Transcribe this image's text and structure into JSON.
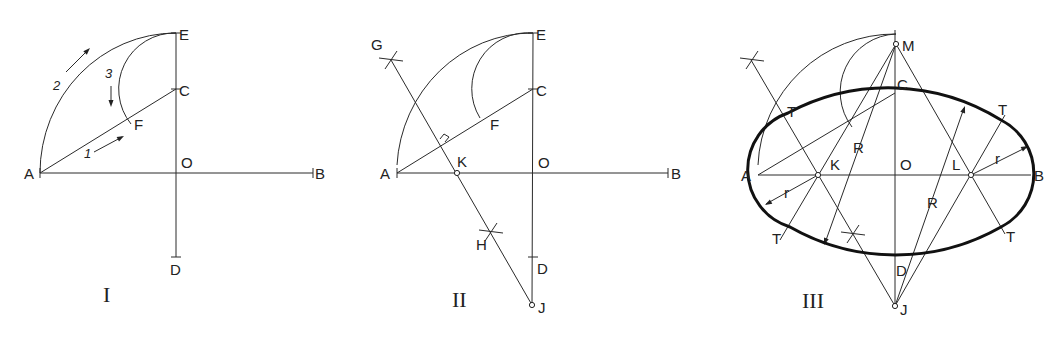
{
  "figure": {
    "panels": [
      {
        "id": "I",
        "numeral": "I",
        "numeral_pos": [
          103,
          302
        ],
        "points": {
          "A": [
            40,
            173
          ],
          "O": [
            176,
            173
          ],
          "B": [
            313,
            173
          ],
          "E": [
            176,
            33
          ],
          "C": [
            176,
            89
          ],
          "D": [
            176,
            257
          ],
          "F": [
            133,
            123
          ]
        },
        "labels": [
          {
            "text": "A",
            "x": 24,
            "y": 179
          },
          {
            "text": "B",
            "x": 315,
            "y": 179
          },
          {
            "text": "O",
            "x": 181,
            "y": 168
          },
          {
            "text": "E",
            "x": 179,
            "y": 40
          },
          {
            "text": "C",
            "x": 179,
            "y": 96
          },
          {
            "text": "D",
            "x": 170,
            "y": 275
          },
          {
            "text": "F",
            "x": 134,
            "y": 130
          }
        ],
        "step_labels": [
          {
            "text": "1",
            "x": 84,
            "y": 158
          },
          {
            "text": "2",
            "x": 53,
            "y": 90
          },
          {
            "text": "3",
            "x": 105,
            "y": 78
          }
        ]
      },
      {
        "id": "II",
        "numeral": "II",
        "numeral_pos": [
          452,
          307
        ],
        "points": {
          "A": [
            397,
            173
          ],
          "K": [
            457,
            173
          ],
          "O": [
            533,
            173
          ],
          "B": [
            668,
            173
          ],
          "E": [
            533,
            33
          ],
          "C": [
            533,
            89
          ],
          "F": [
            485,
            118
          ],
          "D": [
            533,
            257
          ],
          "J": [
            532,
            305
          ],
          "H": [
            491,
            232
          ],
          "G": [
            391,
            60
          ]
        },
        "labels": [
          {
            "text": "A",
            "x": 380,
            "y": 179
          },
          {
            "text": "K",
            "x": 457,
            "y": 167
          },
          {
            "text": "O",
            "x": 538,
            "y": 168
          },
          {
            "text": "B",
            "x": 671,
            "y": 179
          },
          {
            "text": "E",
            "x": 536,
            "y": 40
          },
          {
            "text": "C",
            "x": 536,
            "y": 96
          },
          {
            "text": "F",
            "x": 490,
            "y": 130
          },
          {
            "text": "D",
            "x": 537,
            "y": 274
          },
          {
            "text": "J",
            "x": 538,
            "y": 313
          },
          {
            "text": "H",
            "x": 476,
            "y": 250
          },
          {
            "text": "G",
            "x": 371,
            "y": 50
          }
        ]
      },
      {
        "id": "III",
        "numeral": "III",
        "numeral_pos": [
          802,
          308
        ],
        "points": {
          "A": [
            758,
            175
          ],
          "K": [
            818,
            175
          ],
          "O": [
            895,
            175
          ],
          "L": [
            971,
            175
          ],
          "B": [
            1031,
            175
          ],
          "M": [
            896,
            44
          ],
          "C": [
            895,
            93
          ],
          "D": [
            895,
            258
          ],
          "J": [
            895,
            306
          ]
        },
        "tangent_points": [
          [
            788,
            113
          ],
          [
            1001,
            120
          ],
          [
            790,
            227
          ],
          [
            1001,
            227
          ]
        ],
        "labels": [
          {
            "text": "A",
            "x": 741,
            "y": 181
          },
          {
            "text": "K",
            "x": 830,
            "y": 170
          },
          {
            "text": "O",
            "x": 900,
            "y": 170
          },
          {
            "text": "L",
            "x": 952,
            "y": 170
          },
          {
            "text": "B",
            "x": 1034,
            "y": 181
          },
          {
            "text": "M",
            "x": 902,
            "y": 51
          },
          {
            "text": "C",
            "x": 897,
            "y": 90
          },
          {
            "text": "D",
            "x": 896,
            "y": 276
          },
          {
            "text": "J",
            "x": 900,
            "y": 315
          },
          {
            "text": "R",
            "x": 853,
            "y": 153
          },
          {
            "text": "R",
            "x": 927,
            "y": 208
          },
          {
            "text": "r",
            "x": 784,
            "y": 198
          },
          {
            "text": "r",
            "x": 995,
            "y": 164
          },
          {
            "text": "T",
            "x": 787,
            "y": 117
          },
          {
            "text": "T",
            "x": 998,
            "y": 115
          },
          {
            "text": "T",
            "x": 772,
            "y": 244
          },
          {
            "text": "T",
            "x": 1006,
            "y": 242
          }
        ]
      }
    ]
  }
}
